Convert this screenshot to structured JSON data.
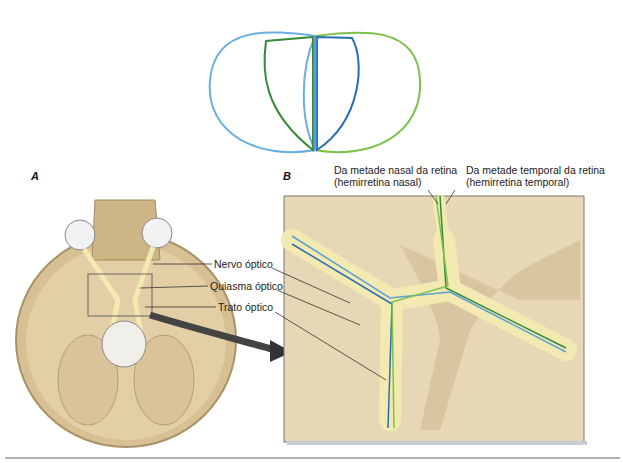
{
  "panels": {
    "a": {
      "letter": "A"
    },
    "b": {
      "letter": "B"
    }
  },
  "labels": {
    "optic_nerve": "Nervo óptico",
    "optic_chiasm": "Quiasma óptico",
    "optic_tract": "Trato óptico",
    "nasal_line1": "Da metade nasal da retina",
    "nasal_line2": "(hemirretina nasal)",
    "temporal_line1": "Da metade temporal da retina",
    "temporal_line2": "(hemirretina temporal)"
  },
  "colors": {
    "visual_field_left": "#6aaee0",
    "visual_field_right": "#7cc24a",
    "nasal_fibers": "#2f8a3c",
    "temporal_fibers": "#2a6db5",
    "nerve": "#f2eab0",
    "bone": "#d9c49a"
  }
}
